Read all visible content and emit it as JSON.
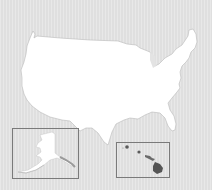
{
  "map": {
    "title": "United States",
    "regions": [
      {
        "name": "Contiguous United States",
        "fill": "#ffffff"
      },
      {
        "name": "Alaska",
        "inset": true,
        "fill": "#ffffff"
      },
      {
        "name": "Hawaii",
        "inset": true,
        "fill": "#5a5a5a"
      }
    ],
    "colors": {
      "background": "#e3e3e3",
      "land": "#ffffff",
      "inset_border": "#7a7a7a",
      "coast_shadow": "#b0b0b0",
      "hawaii_islands": "#5a5a5a"
    }
  }
}
